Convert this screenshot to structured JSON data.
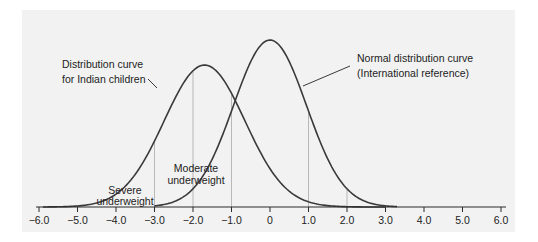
{
  "chart_data": {
    "type": "line",
    "title": "",
    "xlabel": "",
    "ylabel": "",
    "xlim": [
      -6.0,
      6.0
    ],
    "grid": false,
    "x_ticks": [
      -6.0,
      -5.0,
      -4.0,
      -3.0,
      -2.0,
      -1.0,
      0,
      1.0,
      2.0,
      3.0,
      4.0,
      5.0,
      6.0
    ],
    "x_tick_labels": [
      "−6.0",
      "−5.0",
      "−4.0",
      "−3.0",
      "−2.0",
      "−1.0",
      "0",
      "1.0",
      "2.0",
      "3.0",
      "4.0",
      "5.0",
      "6.0"
    ],
    "reference_lines_x": [
      -3.0,
      -2.0,
      -1.0,
      1.0,
      2.0
    ],
    "series": [
      {
        "name": "Distribution curve for Indian children",
        "distribution": "normal",
        "mean": -1.7,
        "sd": 1.05,
        "relative_peak": 0.85,
        "x_range": [
          -5.9,
          3.0
        ]
      },
      {
        "name": "Normal distribution curve (International reference)",
        "distribution": "normal",
        "mean": 0.0,
        "sd": 0.95,
        "relative_peak": 1.0,
        "x_range": [
          -3.0,
          3.3
        ]
      }
    ],
    "annotations": [
      {
        "text_lines": [
          "Distribution curve",
          "for Indian children"
        ],
        "points_to": "Distribution curve for Indian children"
      },
      {
        "text_lines": [
          "Normal distribution curve",
          "(International reference)"
        ],
        "points_to": "Normal distribution curve (International reference)"
      },
      {
        "text_lines": [
          "Moderate",
          "underweight"
        ],
        "region": [
          -3.0,
          -2.0
        ]
      },
      {
        "text_lines": [
          "Severe",
          "underweight"
        ],
        "region": [
          -6.0,
          -3.0
        ]
      }
    ]
  },
  "labels": {
    "indian_1": "Distribution curve",
    "indian_2": "for Indian children",
    "normal_1": "Normal distribution curve",
    "normal_2": "(International reference)",
    "moderate_1": "Moderate",
    "moderate_2": "underweight",
    "severe_1": "Severe",
    "severe_2": "underweight"
  },
  "ticks": [
    "−6.0",
    "−5.0",
    "−4.0",
    "−3.0",
    "−2.0",
    "−1.0",
    "0",
    "1.0",
    "2.0",
    "3.0",
    "4.0",
    "5.0",
    "6.0"
  ],
  "colors": {
    "panel": "#f2f2f2",
    "curve": "#3a3a3a",
    "reference_line": "#a8a8a8",
    "text": "#222222"
  }
}
